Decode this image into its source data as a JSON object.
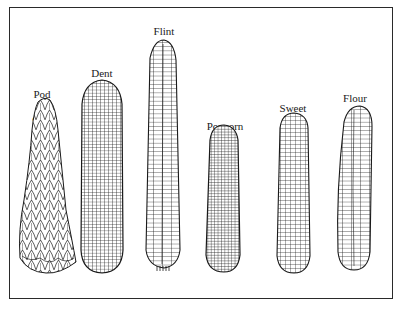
{
  "figure": {
    "title": "",
    "border_color": "#2a2a2a",
    "ink_color": "#1a1a1a"
  },
  "corn_types": [
    {
      "name": "Pod corn",
      "label_line1": "Pod",
      "label_line2": "corn",
      "kernel_style": "leafy-husk"
    },
    {
      "name": "Dent corn",
      "label_line1": "Dent",
      "label_line2": "corn",
      "kernel_style": "dense-grid"
    },
    {
      "name": "Flint corn",
      "label_line1": "Flint",
      "label_line2": "corn",
      "kernel_style": "wide-rows"
    },
    {
      "name": "Popcorn",
      "label_line1": "Popcorn",
      "label_line2": "",
      "kernel_style": "fine-grid"
    },
    {
      "name": "Sweet corn",
      "label_line1": "Sweet",
      "label_line2": "corn",
      "kernel_style": "grid"
    },
    {
      "name": "Flour corn",
      "label_line1": "Flour",
      "label_line2": "corn",
      "kernel_style": "wide-rows"
    }
  ]
}
